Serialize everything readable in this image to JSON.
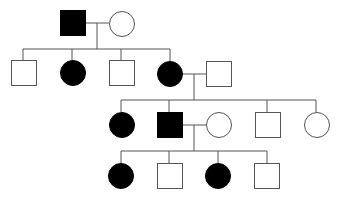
{
  "diagram": {
    "type": "pedigree",
    "colors": {
      "affected": "#000000",
      "unaffected": "#ffffff",
      "stroke": "#555555",
      "line": "#555555"
    },
    "legend": {
      "square": "male",
      "circle": "female",
      "filled": "affected",
      "empty": "unaffected"
    },
    "generations": [
      {
        "id": "I",
        "individuals": [
          {
            "id": "I-1",
            "sex": "male",
            "affected": true,
            "x": 60,
            "y": 10
          },
          {
            "id": "I-2",
            "sex": "female",
            "affected": false,
            "x": 109,
            "y": 11
          }
        ]
      },
      {
        "id": "II",
        "individuals": [
          {
            "id": "II-1",
            "sex": "male",
            "affected": false,
            "x": 11,
            "y": 60
          },
          {
            "id": "II-2",
            "sex": "female",
            "affected": true,
            "x": 60,
            "y": 60
          },
          {
            "id": "II-3",
            "sex": "male",
            "affected": false,
            "x": 109,
            "y": 60
          },
          {
            "id": "II-4",
            "sex": "female",
            "affected": true,
            "x": 157,
            "y": 61
          },
          {
            "id": "II-5",
            "sex": "male",
            "affected": false,
            "x": 206,
            "y": 61,
            "married_in": true
          }
        ]
      },
      {
        "id": "III",
        "individuals": [
          {
            "id": "III-1",
            "sex": "female",
            "affected": true,
            "x": 109,
            "y": 112
          },
          {
            "id": "III-2",
            "sex": "male",
            "affected": true,
            "x": 157,
            "y": 112
          },
          {
            "id": "III-3",
            "sex": "female",
            "affected": false,
            "x": 206,
            "y": 112,
            "married_in": true
          },
          {
            "id": "III-4",
            "sex": "male",
            "affected": false,
            "x": 255,
            "y": 112
          },
          {
            "id": "III-5",
            "sex": "female",
            "affected": false,
            "x": 304,
            "y": 112
          }
        ]
      },
      {
        "id": "IV",
        "individuals": [
          {
            "id": "IV-1",
            "sex": "female",
            "affected": true,
            "x": 108,
            "y": 163
          },
          {
            "id": "IV-2",
            "sex": "male",
            "affected": false,
            "x": 157,
            "y": 163
          },
          {
            "id": "IV-3",
            "sex": "female",
            "affected": true,
            "x": 205,
            "y": 163
          },
          {
            "id": "IV-4",
            "sex": "male",
            "affected": false,
            "x": 254,
            "y": 163
          }
        ]
      }
    ],
    "matings": [
      {
        "partners": [
          "I-1",
          "I-2"
        ],
        "children": [
          "II-1",
          "II-2",
          "II-3",
          "II-4"
        ]
      },
      {
        "partners": [
          "II-4",
          "II-5"
        ],
        "children": [
          "III-1",
          "III-2",
          "III-4",
          "III-5"
        ]
      },
      {
        "partners": [
          "III-2",
          "III-3"
        ],
        "children": [
          "IV-1",
          "IV-2",
          "IV-3",
          "IV-4"
        ]
      }
    ]
  }
}
